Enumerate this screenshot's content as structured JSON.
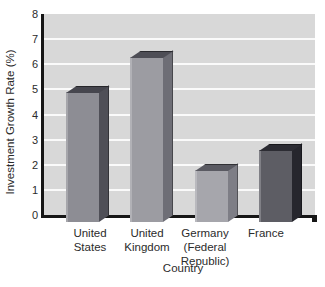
{
  "chart_data": {
    "type": "bar",
    "title": "",
    "xlabel": "Country",
    "ylabel": "Investment Growth Rate (%)",
    "ylim": [
      0,
      8
    ],
    "yticks": [
      0,
      1,
      2,
      3,
      4,
      5,
      6,
      7,
      8
    ],
    "grid": "horizontal white gridlines on gray plot background",
    "legend": "none",
    "categories": [
      "United States",
      "United Kingdom",
      "Germany (Federal Republic)",
      "France"
    ],
    "category_label_lines": [
      [
        "United",
        "States"
      ],
      [
        "United",
        "Kingdom"
      ],
      [
        "Germany",
        "(Federal",
        "Republic)"
      ],
      [
        "France"
      ]
    ],
    "values": [
      4.9,
      6.3,
      1.8,
      2.6
    ],
    "bar_style": "3d-box",
    "bar_colors": [
      {
        "front": "#8d8d94",
        "side": "#4f4f57",
        "top": "#46464e"
      },
      {
        "front": "#9c9ca2",
        "side": "#6e6e76",
        "top": "#4e4e56"
      },
      {
        "front": "#a6a6ac",
        "side": "#7e7e86",
        "top": "#5a5a62"
      },
      {
        "front": "#5d5d64",
        "side": "#26262d",
        "top": "#2c2c33"
      }
    ],
    "colors": {
      "page_bg": "#ffffff",
      "plot_bg": "#d8d8d8",
      "gridline": "#fafafa",
      "axis": "#161616",
      "text": "#2b2b2b"
    }
  }
}
